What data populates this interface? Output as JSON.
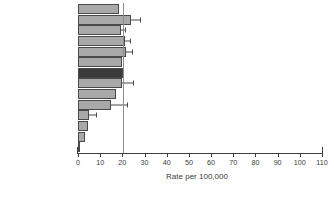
{
  "chart_data": {
    "type": "bar",
    "orientation": "horizontal",
    "title": "",
    "xlabel": "Rate per 100,000",
    "ylabel": "",
    "xlim": [
      0,
      110
    ],
    "xticks": [
      0,
      10,
      20,
      30,
      40,
      50,
      60,
      70,
      80,
      90,
      100,
      110
    ],
    "grid": false,
    "legend": null,
    "reference_line": 20.2,
    "categories": [
      "USA",
      "Sweden",
      "Australia",
      "The Netherlands",
      "Zimbabwe",
      "Brazil",
      "England and Wales",
      "Costa Rica",
      "Italy",
      "Estonia",
      "Singapore",
      "Japan",
      "India",
      "China"
    ],
    "values": [
      18.5,
      24.0,
      19.5,
      21.0,
      21.5,
      20.0,
      20.2,
      20.0,
      17.0,
      15.0,
      5.0,
      4.5,
      3.0,
      0.7
    ],
    "error_high": [
      18.5,
      28.0,
      21.0,
      23.5,
      24.5,
      20.0,
      20.2,
      25.0,
      17.0,
      22.0,
      8.0,
      4.5,
      3.0,
      0.7
    ],
    "bar_styles": [
      "light",
      "light",
      "light",
      "light",
      "light",
      "light",
      "dark",
      "light",
      "light",
      "light",
      "light",
      "light",
      "light",
      "dark"
    ],
    "colors": {
      "bar_light": "#a9a9a9",
      "bar_dark": "#3b3b3b",
      "bar_border": "#4a4a4a",
      "axis": "#3f3f3f",
      "reference_line": "#8c8c8c",
      "text": "#3a3a3a",
      "background": "#ffffff"
    }
  }
}
